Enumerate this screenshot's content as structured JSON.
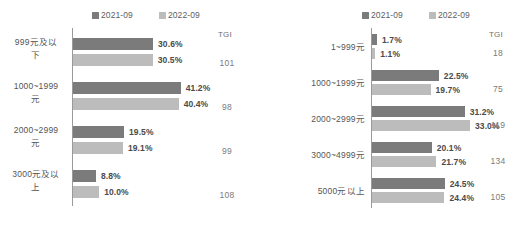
{
  "legend": {
    "series": [
      {
        "label": "2021-09",
        "color": "#7b7b7b",
        "icon": "legend-square-icon"
      },
      {
        "label": "2022-09",
        "color": "#bcbcbc",
        "icon": "legend-square-icon"
      }
    ]
  },
  "tgi_header": "TGI",
  "chart_data": [
    {
      "type": "bar",
      "orientation": "horizontal",
      "title": "",
      "subtitle": "",
      "xlabel": "",
      "ylabel": "",
      "grid": false,
      "legend_position": "top",
      "axis_visible": "y",
      "xlim": [
        0,
        45
      ],
      "categories": [
        "999元及以\n下",
        "1000~1999\n元",
        "2000~2999\n元",
        "3000元及以\n上"
      ],
      "series": [
        {
          "name": "2021-09",
          "color": "#7b7b7b",
          "values": [
            30.6,
            41.2,
            19.5,
            8.8
          ],
          "labels": [
            "30.6%",
            "41.2%",
            "19.5%",
            "8.8%"
          ]
        },
        {
          "name": "2022-09",
          "color": "#bcbcbc",
          "values": [
            30.5,
            40.4,
            19.1,
            10.0
          ],
          "labels": [
            "30.5%",
            "40.4%",
            "19.1%",
            "10.0%"
          ]
        }
      ],
      "annotations": {
        "tgi_label": "TGI",
        "tgi": [
          "101",
          "98",
          "99",
          "108"
        ]
      }
    },
    {
      "type": "bar",
      "orientation": "horizontal",
      "title": "",
      "subtitle": "",
      "xlabel": "",
      "ylabel": "",
      "grid": false,
      "legend_position": "top",
      "axis_visible": "y",
      "xlim": [
        0,
        36
      ],
      "categories": [
        "1~999元",
        "1000~1999元",
        "2000~2999元",
        "3000~4999元",
        "5000元以上"
      ],
      "series": [
        {
          "name": "2021-09",
          "color": "#7b7b7b",
          "values": [
            1.7,
            22.5,
            31.2,
            20.1,
            24.5
          ],
          "labels": [
            "1.7%",
            "22.5%",
            "31.2%",
            "20.1%",
            "24.5%"
          ]
        },
        {
          "name": "2022-09",
          "color": "#bcbcbc",
          "values": [
            1.1,
            19.7,
            33.0,
            21.7,
            24.4
          ],
          "labels": [
            "1.1%",
            "19.7%",
            "33.0%",
            "21.7%",
            "24.4%"
          ]
        }
      ],
      "annotations": {
        "tgi_label": "TGI",
        "tgi": [
          "18",
          "75",
          "119",
          "134",
          "105"
        ]
      }
    }
  ]
}
